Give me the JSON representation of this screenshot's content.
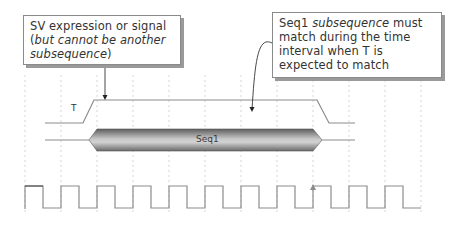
{
  "callouts": {
    "left": {
      "part1": "SV expression or signal (",
      "part2_italic": "but cannot be another subsequence",
      "part3": ")"
    },
    "right": {
      "part1": "Seq1 ",
      "part2_italic": "subsequence",
      "part3": " must match during the time interval when T is expected to match"
    }
  },
  "signals": {
    "t_label": "T",
    "seq_label": "Seq1"
  },
  "colors": {
    "wave": "#8c8c8c",
    "grid": "#d8d8d8",
    "callout_border": "#8a8a8a",
    "seq_fill_dark": "#6e6e6e",
    "seq_fill_light": "#d6d6d6"
  }
}
